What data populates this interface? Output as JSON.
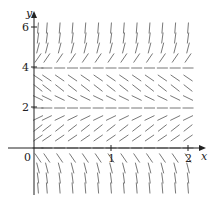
{
  "diagram": {
    "type": "slope_field",
    "equation_form": "dy/dx = y(y-2)(y-4)",
    "axes": {
      "x_label": "x",
      "y_label": "y",
      "x_ticks": [
        {
          "value": 1,
          "label": "1"
        },
        {
          "value": 2,
          "label": "2"
        }
      ],
      "y_ticks": [
        {
          "value": 2,
          "label": "2"
        },
        {
          "value": 4,
          "label": "4"
        },
        {
          "value": 6,
          "label": "6"
        }
      ],
      "origin_label": "0",
      "x_range": [
        0,
        2
      ],
      "y_range": [
        -2,
        6
      ]
    },
    "equilibria": [
      0,
      2,
      4
    ],
    "grid": {
      "x_step": 0.1667,
      "x_count": 13,
      "y_values": [
        6,
        5.5,
        5,
        4.5,
        4,
        3.5,
        3,
        2.5,
        2,
        1.5,
        1,
        0.5,
        0,
        -0.5,
        -1,
        -1.5,
        -2
      ]
    },
    "colors": {
      "axis": "#222222",
      "segment": "#555555"
    }
  }
}
